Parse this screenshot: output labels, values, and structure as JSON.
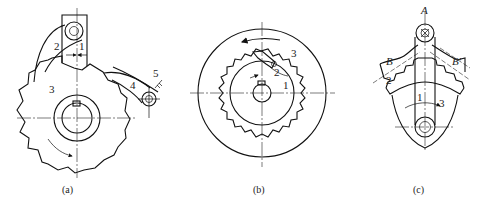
{
  "figure": {
    "panels": [
      {
        "id": "a",
        "caption": "(a)",
        "description": "External ratchet (saw-tooth wheel) with pawl and spring-loaded roller",
        "labels": {
          "part1": "1",
          "part2": "2",
          "part3": "3",
          "part4": "4",
          "part5": "5"
        }
      },
      {
        "id": "b",
        "caption": "(b)",
        "description": "Internal ratchet wheel with pawl inside an outer ring",
        "labels": {
          "part1": "1",
          "part2": "2",
          "part3": "3"
        }
      },
      {
        "id": "c",
        "caption": "(c)",
        "description": "Rocker with toothed sector and pawl pivoting about point A",
        "labels": {
          "part1": "1",
          "part2": "2",
          "part3": "3",
          "pointA": "A",
          "lineB": "B",
          "lineB2": "B′"
        }
      }
    ]
  },
  "colors": {
    "line": "#111111",
    "background": "#ffffff"
  }
}
